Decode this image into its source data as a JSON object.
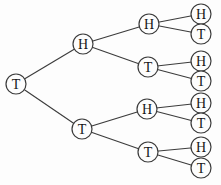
{
  "diagram": {
    "type": "binary-tree",
    "colors": {
      "background": "#fdfdfd",
      "node_fill": "#fdfdfd",
      "node_stroke": "#3b3b3b",
      "edge_stroke": "#3b3b3b",
      "label_text": "#161616"
    },
    "node_radius": 10,
    "nodes": [
      {
        "id": "root",
        "label": "T",
        "x": 16,
        "y": 84
      },
      {
        "id": "h",
        "label": "H",
        "x": 83,
        "y": 44
      },
      {
        "id": "t",
        "label": "T",
        "x": 82,
        "y": 129
      },
      {
        "id": "hh",
        "label": "H",
        "x": 149,
        "y": 24
      },
      {
        "id": "ht",
        "label": "T",
        "x": 148,
        "y": 67
      },
      {
        "id": "th",
        "label": "H",
        "x": 147,
        "y": 109
      },
      {
        "id": "tt",
        "label": "T",
        "x": 148,
        "y": 152
      },
      {
        "id": "hhh",
        "label": "H",
        "x": 201,
        "y": 14
      },
      {
        "id": "hht",
        "label": "T",
        "x": 201,
        "y": 34
      },
      {
        "id": "hth",
        "label": "H",
        "x": 201,
        "y": 61
      },
      {
        "id": "htt",
        "label": "T",
        "x": 201,
        "y": 81
      },
      {
        "id": "thh",
        "label": "H",
        "x": 201,
        "y": 103
      },
      {
        "id": "tht",
        "label": "T",
        "x": 201,
        "y": 123
      },
      {
        "id": "tth",
        "label": "H",
        "x": 201,
        "y": 147
      },
      {
        "id": "ttt",
        "label": "T",
        "x": 201,
        "y": 168
      }
    ],
    "edges": [
      [
        "root",
        "h"
      ],
      [
        "root",
        "t"
      ],
      [
        "h",
        "hh"
      ],
      [
        "h",
        "ht"
      ],
      [
        "t",
        "th"
      ],
      [
        "t",
        "tt"
      ],
      [
        "hh",
        "hhh"
      ],
      [
        "hh",
        "hht"
      ],
      [
        "ht",
        "hth"
      ],
      [
        "ht",
        "htt"
      ],
      [
        "th",
        "thh"
      ],
      [
        "th",
        "tht"
      ],
      [
        "tt",
        "tth"
      ],
      [
        "tt",
        "ttt"
      ]
    ]
  }
}
